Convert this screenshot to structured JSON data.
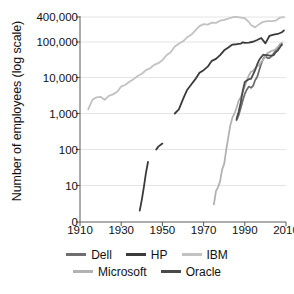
{
  "chart_data": {
    "type": "line",
    "title": "",
    "xlabel": "",
    "ylabel": "Number of employees (log scale)",
    "xlim": [
      1910,
      2010
    ],
    "ylim_log": [
      1,
      400000
    ],
    "grid": true,
    "legend_position": "bottom",
    "xticks": [
      1910,
      1930,
      1950,
      1970,
      1990,
      2010
    ],
    "xtick_labels": [
      "1910",
      "1930",
      "1950",
      "1970",
      "1990",
      "2010"
    ],
    "yticks": [
      0,
      10,
      100,
      1000,
      10000,
      100000,
      400000
    ],
    "ytick_labels": [
      "0",
      "10",
      "100",
      "1,000",
      "10,000",
      "100,000",
      "400,000"
    ],
    "series": [
      {
        "name": "Dell",
        "color": "#6e6e6e",
        "points": [
          [
            1986,
            650
          ],
          [
            1987,
            900
          ],
          [
            1988,
            1400
          ],
          [
            1989,
            2300
          ],
          [
            1990,
            3500
          ],
          [
            1991,
            4650
          ],
          [
            1992,
            5600
          ],
          [
            1993,
            5200
          ],
          [
            1994,
            5800
          ],
          [
            1995,
            8400
          ],
          [
            1996,
            10350
          ],
          [
            1997,
            16000
          ],
          [
            1998,
            24400
          ],
          [
            1999,
            33200
          ],
          [
            2000,
            40000
          ],
          [
            2001,
            34600
          ],
          [
            2002,
            34600
          ],
          [
            2003,
            39100
          ],
          [
            2004,
            46000
          ],
          [
            2005,
            55200
          ],
          [
            2006,
            65200
          ],
          [
            2007,
            82700
          ],
          [
            2008,
            78900
          ]
        ]
      },
      {
        "name": "HP",
        "color": "#3a3a3a",
        "points": [
          [
            1939,
            2
          ],
          [
            1940,
            4
          ],
          [
            1941,
            9
          ],
          [
            1942,
            22
          ],
          [
            1943,
            45
          ],
          [
            1947,
            100
          ],
          [
            1948,
            120
          ],
          [
            1950,
            146
          ],
          [
            1956,
            1000
          ],
          [
            1958,
            1300
          ],
          [
            1960,
            2500
          ],
          [
            1962,
            4500
          ],
          [
            1964,
            6400
          ],
          [
            1966,
            9000
          ],
          [
            1968,
            13500
          ],
          [
            1970,
            16000
          ],
          [
            1972,
            20000
          ],
          [
            1974,
            29000
          ],
          [
            1976,
            33000
          ],
          [
            1978,
            42000
          ],
          [
            1980,
            57000
          ],
          [
            1982,
            68000
          ],
          [
            1984,
            82000
          ],
          [
            1986,
            84000
          ],
          [
            1988,
            87000
          ],
          [
            1989,
            95000
          ],
          [
            1990,
            91500
          ],
          [
            1992,
            92600
          ],
          [
            1994,
            98400
          ],
          [
            1996,
            112000
          ],
          [
            1998,
            124600
          ],
          [
            2000,
            88500
          ],
          [
            2002,
            141000
          ],
          [
            2004,
            151000
          ],
          [
            2006,
            156000
          ],
          [
            2008,
            172000
          ],
          [
            2009,
            190000
          ]
        ]
      },
      {
        "name": "IBM",
        "color": "#c2c2c2",
        "points": [
          [
            1914,
            1300
          ],
          [
            1916,
            2400
          ],
          [
            1918,
            2800
          ],
          [
            1920,
            2900
          ],
          [
            1922,
            2400
          ],
          [
            1924,
            3100
          ],
          [
            1926,
            3400
          ],
          [
            1928,
            4000
          ],
          [
            1930,
            5600
          ],
          [
            1932,
            6300
          ],
          [
            1934,
            7600
          ],
          [
            1936,
            9000
          ],
          [
            1938,
            11000
          ],
          [
            1940,
            12700
          ],
          [
            1942,
            16000
          ],
          [
            1944,
            18000
          ],
          [
            1946,
            22500
          ],
          [
            1948,
            25000
          ],
          [
            1950,
            30300
          ],
          [
            1952,
            41500
          ],
          [
            1954,
            50200
          ],
          [
            1956,
            72500
          ],
          [
            1958,
            87000
          ],
          [
            1960,
            104000
          ],
          [
            1962,
            130000
          ],
          [
            1964,
            149000
          ],
          [
            1966,
            190000
          ],
          [
            1968,
            241000
          ],
          [
            1970,
            269000
          ],
          [
            1972,
            262000
          ],
          [
            1974,
            292000
          ],
          [
            1976,
            288000
          ],
          [
            1978,
            325000
          ],
          [
            1980,
            341000
          ],
          [
            1982,
            364000
          ],
          [
            1984,
            395000
          ],
          [
            1986,
            403000
          ],
          [
            1988,
            387000
          ],
          [
            1990,
            373000
          ],
          [
            1992,
            302000
          ],
          [
            1993,
            256000
          ],
          [
            1995,
            225000
          ],
          [
            1997,
            269000
          ],
          [
            1999,
            307000
          ],
          [
            2001,
            319000
          ],
          [
            2003,
            319000
          ],
          [
            2005,
            329000
          ],
          [
            2007,
            386000
          ],
          [
            2009,
            399000
          ]
        ]
      },
      {
        "name": "Microsoft",
        "color": "#b2b2b2",
        "points": [
          [
            1975,
            3
          ],
          [
            1976,
            7
          ],
          [
            1977,
            9
          ],
          [
            1978,
            13
          ],
          [
            1979,
            28
          ],
          [
            1980,
            40
          ],
          [
            1981,
            100
          ],
          [
            1982,
            220
          ],
          [
            1983,
            476
          ],
          [
            1984,
            778
          ],
          [
            1985,
            1001
          ],
          [
            1986,
            1442
          ],
          [
            1987,
            2258
          ],
          [
            1988,
            2793
          ],
          [
            1989,
            4037
          ],
          [
            1990,
            5635
          ],
          [
            1991,
            8226
          ],
          [
            1992,
            11542
          ],
          [
            1993,
            14430
          ],
          [
            1994,
            15257
          ],
          [
            1995,
            17801
          ],
          [
            1996,
            20561
          ],
          [
            1997,
            22232
          ],
          [
            1998,
            27320
          ],
          [
            1999,
            31396
          ],
          [
            2000,
            39100
          ],
          [
            2001,
            47600
          ],
          [
            2002,
            50500
          ],
          [
            2003,
            55000
          ],
          [
            2004,
            57000
          ],
          [
            2005,
            61000
          ],
          [
            2006,
            71000
          ],
          [
            2007,
            79000
          ],
          [
            2008,
            91000
          ]
        ]
      },
      {
        "name": "Oracle",
        "color": "#4a4a4a",
        "points": [
          [
            1986,
            700
          ],
          [
            1987,
            1100
          ],
          [
            1988,
            2000
          ],
          [
            1989,
            4200
          ],
          [
            1990,
            7500
          ],
          [
            1991,
            8200
          ],
          [
            1992,
            9000
          ],
          [
            1993,
            9200
          ],
          [
            1994,
            12000
          ],
          [
            1995,
            16000
          ],
          [
            1996,
            23000
          ],
          [
            1997,
            31000
          ],
          [
            1998,
            37000
          ],
          [
            1999,
            43000
          ],
          [
            2000,
            42000
          ],
          [
            2001,
            42000
          ],
          [
            2002,
            40650
          ],
          [
            2003,
            40650
          ],
          [
            2004,
            41650
          ],
          [
            2005,
            50000
          ],
          [
            2006,
            56000
          ],
          [
            2007,
            68000
          ],
          [
            2008,
            84000
          ]
        ]
      }
    ]
  },
  "axes": {
    "ylabel": "Number of employees (log scale)"
  },
  "legend": {
    "rows": [
      [
        {
          "label": "Dell",
          "color": "#6e6e6e"
        },
        {
          "label": "HP",
          "color": "#3a3a3a"
        },
        {
          "label": "IBM",
          "color": "#c2c2c2"
        }
      ],
      [
        {
          "label": "Microsoft",
          "color": "#b2b2b2"
        },
        {
          "label": "Oracle",
          "color": "#4a4a4a"
        }
      ]
    ]
  }
}
